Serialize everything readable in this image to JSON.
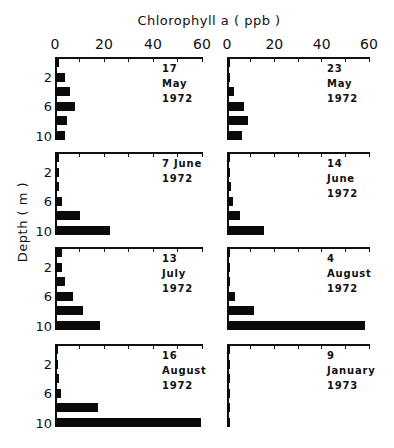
{
  "chart_data": {
    "type": "bar",
    "orientation": "horizontal",
    "xlabel": "Chlorophyll a (ppb)",
    "ylabel": "Depth (m)",
    "xlim": [
      0,
      60
    ],
    "x_ticks": [
      0,
      20,
      40,
      60
    ],
    "y_ticks": [
      2,
      6,
      10
    ],
    "categories": [
      0,
      2,
      4,
      6,
      8,
      10
    ],
    "grid": false,
    "panels": [
      {
        "label": "17 May 1972",
        "line1": "17 May",
        "line2": "1972",
        "values": [
          1.5,
          4,
          6,
          8,
          5,
          4
        ]
      },
      {
        "label": "23 May 1972",
        "line1": "23 May",
        "line2": "1972",
        "values": [
          1,
          1,
          3,
          7,
          9,
          6.5
        ]
      },
      {
        "label": "7 June 1972",
        "line1": "7 June",
        "line2": "1972",
        "values": [
          1.5,
          1.5,
          1.5,
          3,
          10,
          22.5
        ]
      },
      {
        "label": "14 June 1972",
        "line1": "14 June",
        "line2": "1972",
        "values": [
          0.8,
          1,
          1.5,
          2.5,
          5.5,
          15.5
        ]
      },
      {
        "label": "13 July 1972",
        "line1": "13 July",
        "line2": "1972",
        "values": [
          3,
          3,
          4,
          7.5,
          11.5,
          18.5
        ]
      },
      {
        "label": "4 August 1972",
        "line1": "4 August",
        "line2": "1972",
        "values": [
          0.8,
          1,
          1,
          3.5,
          11.5,
          58.5
        ]
      },
      {
        "label": "16 August 1972",
        "line1": "16 August",
        "line2": "1972",
        "values": [
          0.8,
          0.8,
          1.5,
          2.5,
          17.5,
          59.5
        ]
      },
      {
        "label": "9 January 1973",
        "line1": "9 January",
        "line2": "1973",
        "values": [
          1,
          1,
          1,
          1,
          1,
          1
        ]
      }
    ]
  },
  "labels": {
    "title": "Chlorophyll a  ( ppb )",
    "ylabel": "Depth  ( m )",
    "x_ticks": [
      "0",
      "20",
      "40",
      "60"
    ],
    "depth_ticks": [
      "2",
      "6",
      "10"
    ]
  },
  "colors": {
    "bar": "#0a0a0a",
    "axis": "#111111",
    "background": "#ffffff"
  }
}
